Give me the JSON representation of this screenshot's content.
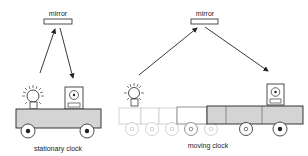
{
  "diagram": {
    "left": {
      "mirror_label": "mirror",
      "caption": "stationary clock"
    },
    "right": {
      "mirror_label": "mirror",
      "caption": "moving clock"
    },
    "colors": {
      "cart_fill": "#d4d4d4",
      "stroke": "#222222",
      "ghost": "#c8c8c8"
    }
  }
}
